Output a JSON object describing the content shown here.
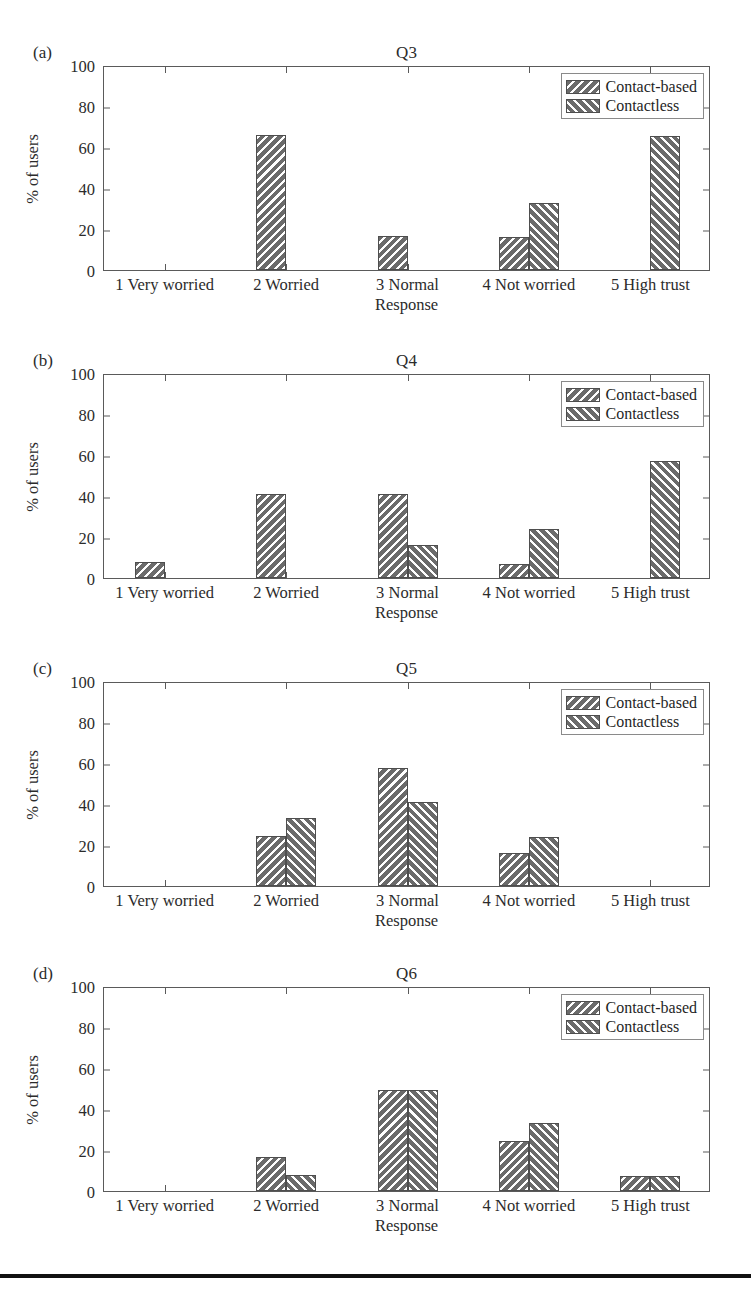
{
  "figure": {
    "width": 751,
    "height": 1304,
    "background": "#ffffff",
    "rule_color": "#111111"
  },
  "series_names": [
    "Contact-based",
    "Contactless"
  ],
  "legend": {
    "items": [
      {
        "label": "Contact-based",
        "hatch": "backslash",
        "swatch": "legend-swatch-contact-based"
      },
      {
        "label": "Contactless",
        "hatch": "forwardslash",
        "swatch": "legend-swatch-contactless"
      }
    ]
  },
  "axis": {
    "ylabel": "% of users",
    "xlabel": "Response",
    "yticks": [
      "0",
      "20",
      "40",
      "60",
      "80",
      "100"
    ],
    "ylim": [
      0,
      100
    ],
    "xticklabels": [
      "1 Very worried",
      "2 Worried",
      "3 Normal",
      "4 Not worried",
      "5 High trust"
    ]
  },
  "panels": [
    {
      "tag": "(a)",
      "title": "Q3"
    },
    {
      "tag": "(b)",
      "title": "Q4"
    },
    {
      "tag": "(c)",
      "title": "Q5"
    },
    {
      "tag": "(d)",
      "title": "Q6"
    }
  ],
  "chart_data": [
    {
      "type": "bar",
      "panel": "(a)",
      "title": "Q3",
      "xlabel": "Response",
      "ylabel": "% of users",
      "ylim": [
        0,
        100
      ],
      "yticks": [
        0,
        20,
        40,
        60,
        80,
        100
      ],
      "grid": false,
      "legend_position": "upper right",
      "categories": [
        "1 Very worried",
        "2 Worried",
        "3 Normal",
        "4 Not worried",
        "5 High trust"
      ],
      "series": [
        {
          "name": "Contact-based",
          "values": [
            0,
            66,
            16.5,
            16,
            0
          ]
        },
        {
          "name": "Contactless",
          "values": [
            0,
            0,
            0,
            32.5,
            65.5
          ]
        }
      ]
    },
    {
      "type": "bar",
      "panel": "(b)",
      "title": "Q4",
      "xlabel": "Response",
      "ylabel": "% of users",
      "ylim": [
        0,
        100
      ],
      "yticks": [
        0,
        20,
        40,
        60,
        80,
        100
      ],
      "grid": false,
      "legend_position": "upper right",
      "categories": [
        "1 Very worried",
        "2 Worried",
        "3 Normal",
        "4 Not worried",
        "5 High trust"
      ],
      "series": [
        {
          "name": "Contact-based",
          "values": [
            8,
            41,
            41,
            7,
            0
          ]
        },
        {
          "name": "Contactless",
          "values": [
            0,
            0,
            16,
            24,
            57
          ]
        }
      ]
    },
    {
      "type": "bar",
      "panel": "(c)",
      "title": "Q5",
      "xlabel": "Response",
      "ylabel": "% of users",
      "ylim": [
        0,
        100
      ],
      "yticks": [
        0,
        20,
        40,
        60,
        80,
        100
      ],
      "grid": false,
      "legend_position": "upper right",
      "categories": [
        "1 Very worried",
        "2 Worried",
        "3 Normal",
        "4 Not worried",
        "5 High trust"
      ],
      "series": [
        {
          "name": "Contact-based",
          "values": [
            0,
            24.5,
            57.5,
            16,
            0
          ]
        },
        {
          "name": "Contactless",
          "values": [
            0,
            33,
            41,
            24,
            0
          ]
        }
      ]
    },
    {
      "type": "bar",
      "panel": "(d)",
      "title": "Q6",
      "xlabel": "Response",
      "ylabel": "% of users",
      "ylim": [
        0,
        100
      ],
      "yticks": [
        0,
        20,
        40,
        60,
        80,
        100
      ],
      "grid": false,
      "legend_position": "upper right",
      "categories": [
        "1 Very worried",
        "2 Worried",
        "3 Normal",
        "4 Not worried",
        "5 High trust"
      ],
      "series": [
        {
          "name": "Contact-based",
          "values": [
            0,
            16.5,
            49.5,
            24.5,
            7.5
          ]
        },
        {
          "name": "Contactless",
          "values": [
            0,
            8,
            49.5,
            33,
            7.5
          ]
        }
      ]
    }
  ]
}
